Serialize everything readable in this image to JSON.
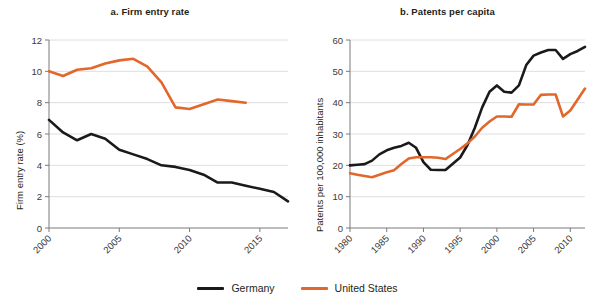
{
  "figure": {
    "panels": [
      {
        "id": "a",
        "title": "a. Firm entry rate",
        "ylabel": "Firm entry rate (%)",
        "xlabel": ""
      },
      {
        "id": "b",
        "title": "b. Patents per capita",
        "ylabel": "Patents per 100,000 inhabitants",
        "xlabel": ""
      }
    ]
  },
  "legend": {
    "position": "bottom-center",
    "entries": [
      {
        "label": "Germany",
        "color": "#1a1a1a"
      },
      {
        "label": "United States",
        "color": "#E2672B"
      }
    ]
  },
  "colors": {
    "germany": "#1a1a1a",
    "united_states": "#E2672B",
    "grid": "#d6d6d6",
    "axis": "#7a7a7a",
    "text": "#231f20"
  },
  "chart_data": [
    {
      "type": "line",
      "panel": "a",
      "title": "a. Firm entry rate",
      "xlabel": "",
      "ylabel": "Firm entry rate (%)",
      "xlim": [
        2000,
        2017
      ],
      "ylim": [
        0,
        12
      ],
      "yticks": [
        0,
        2,
        4,
        6,
        8,
        10,
        12
      ],
      "xticks": [
        2000,
        2005,
        2010,
        2015
      ],
      "xtick_labels": [
        "2000",
        "2005",
        "2010",
        "2015"
      ],
      "ytick_labels": [
        "0",
        "2",
        "4",
        "6",
        "8",
        "10",
        "12"
      ],
      "grid": "horizontal",
      "legend": "bottom",
      "series": [
        {
          "name": "Germany",
          "color": "#1a1a1a",
          "x": [
            2000,
            2001,
            2002,
            2003,
            2004,
            2005,
            2006,
            2007,
            2008,
            2009,
            2010,
            2011,
            2012,
            2013,
            2014,
            2015,
            2016,
            2017
          ],
          "values": [
            6.9,
            6.1,
            5.6,
            6.0,
            5.7,
            5.0,
            4.7,
            4.4,
            4.0,
            3.9,
            3.7,
            3.4,
            2.9,
            2.9,
            2.7,
            2.5,
            2.3,
            1.7
          ]
        },
        {
          "name": "United States",
          "color": "#E2672B",
          "x": [
            2000,
            2001,
            2002,
            2003,
            2004,
            2005,
            2006,
            2007,
            2008,
            2009,
            2010,
            2011,
            2012,
            2013,
            2014
          ],
          "values": [
            10.0,
            9.7,
            10.1,
            10.2,
            10.5,
            10.7,
            10.8,
            10.3,
            9.3,
            7.7,
            7.6,
            7.9,
            8.2,
            8.1,
            8.0
          ]
        }
      ]
    },
    {
      "type": "line",
      "panel": "b",
      "title": "b. Patents per capita",
      "xlabel": "",
      "ylabel": "Patents per 100,000 inhabitants",
      "xlim": [
        1980,
        2012
      ],
      "ylim": [
        0,
        60
      ],
      "yticks": [
        0,
        10,
        20,
        30,
        40,
        50,
        60
      ],
      "xticks": [
        1980,
        1985,
        1990,
        1995,
        2000,
        2005,
        2010
      ],
      "xtick_labels": [
        "1980",
        "1985",
        "1990",
        "1995",
        "2000",
        "2005",
        "2010"
      ],
      "ytick_labels": [
        "0",
        "10",
        "20",
        "30",
        "40",
        "50",
        "60"
      ],
      "grid": "horizontal",
      "legend": "bottom",
      "series": [
        {
          "name": "Germany",
          "color": "#1a1a1a",
          "x": [
            1980,
            1981,
            1982,
            1983,
            1984,
            1985,
            1986,
            1987,
            1988,
            1989,
            1990,
            1991,
            1992,
            1993,
            1994,
            1995,
            1996,
            1997,
            1998,
            1999,
            2000,
            2001,
            2002,
            2003,
            2004,
            2005,
            2006,
            2007,
            2008,
            2009,
            2010,
            2011,
            2012
          ],
          "values": [
            20.0,
            20.2,
            20.4,
            21.5,
            23.5,
            24.8,
            25.6,
            26.2,
            27.2,
            25.6,
            21.0,
            18.6,
            18.5,
            18.5,
            20.5,
            22.5,
            26.5,
            32.0,
            38.5,
            43.5,
            45.5,
            43.5,
            43.2,
            45.5,
            52.0,
            55.0,
            56.0,
            56.8,
            56.8,
            54.0,
            55.5,
            56.5,
            57.8
          ]
        },
        {
          "name": "United States",
          "color": "#E2672B",
          "x": [
            1980,
            1981,
            1982,
            1983,
            1984,
            1985,
            1986,
            1987,
            1988,
            1989,
            1990,
            1991,
            1992,
            1993,
            1994,
            1995,
            1996,
            1997,
            1998,
            1999,
            2000,
            2001,
            2002,
            2003,
            2004,
            2005,
            2006,
            2007,
            2008,
            2009,
            2010,
            2011,
            2012
          ],
          "values": [
            17.5,
            17.0,
            16.6,
            16.2,
            17.0,
            17.8,
            18.4,
            20.4,
            22.2,
            22.6,
            22.6,
            22.6,
            22.4,
            22.0,
            23.6,
            25.2,
            27.0,
            29.2,
            32.0,
            34.0,
            35.6,
            35.6,
            35.5,
            39.5,
            39.4,
            39.4,
            42.5,
            42.6,
            42.6,
            35.6,
            37.5,
            41.0,
            44.5
          ]
        }
      ]
    }
  ]
}
